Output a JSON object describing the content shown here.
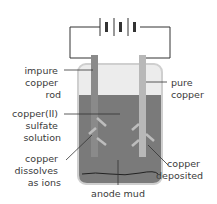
{
  "diagram": {
    "labels": {
      "impure_copper_rod": [
        "impure",
        "copper",
        "rod"
      ],
      "pure_copper": [
        "pure",
        "copper"
      ],
      "solution": [
        "copper(II)",
        "sulfate",
        "solution"
      ],
      "copper_dissolves": [
        "copper",
        "dissolves",
        "as ions"
      ],
      "copper_deposited": [
        "copper",
        "deposited"
      ],
      "anode_mud": [
        "anode mud"
      ]
    },
    "colors": {
      "solution": "#7a7a7a",
      "air": "#ececec",
      "beaker_outline": "#cfcfcf",
      "anode": "#8a8a8a",
      "cathode": "#b8b8b8",
      "wire": "#333333",
      "arrow": "#bdbdbd"
    }
  }
}
